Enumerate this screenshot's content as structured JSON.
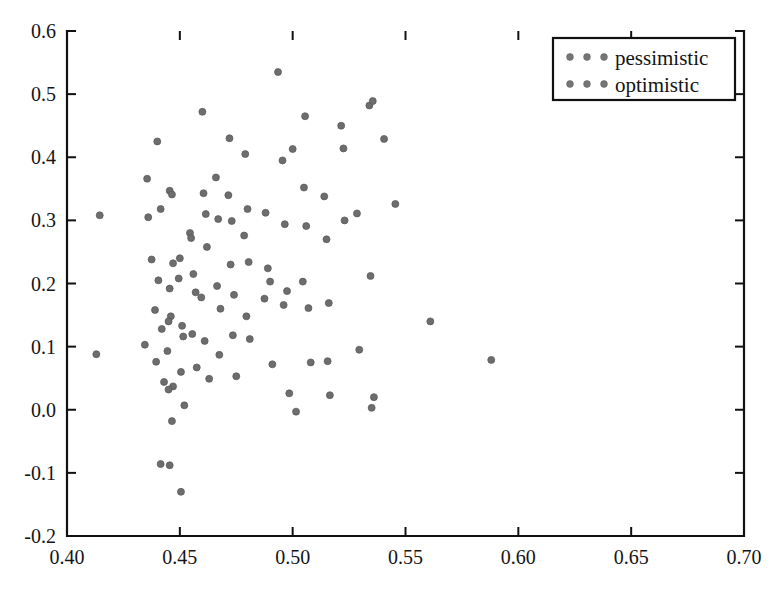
{
  "chart_data": {
    "type": "scatter",
    "title": "",
    "xlabel": "",
    "ylabel": "",
    "xlim": [
      0.4,
      0.7
    ],
    "ylim": [
      -0.2,
      0.6
    ],
    "grid": false,
    "xticks": [
      0.4,
      0.45,
      0.5,
      0.55,
      0.6,
      0.65,
      0.7
    ],
    "xtick_labels": [
      "0.40",
      "0.45",
      "0.50",
      "0.55",
      "0.60",
      "0.65",
      "0.70"
    ],
    "yticks": [
      -0.2,
      -0.1,
      0.0,
      0.1,
      0.2,
      0.3,
      0.4,
      0.5,
      0.6
    ],
    "ytick_labels": [
      "-0.2",
      "-0.1",
      "0.0",
      "0.1",
      "0.2",
      "0.3",
      "0.4",
      "0.5",
      "0.6"
    ],
    "marker_color": "#6d6d6d",
    "marker_size": 7,
    "legend": {
      "position": "upper right",
      "entries": [
        {
          "label": "pessimistic",
          "color": "#767676",
          "marker": "circle"
        },
        {
          "label": "optimistic",
          "color": "#767676",
          "marker": "circle"
        }
      ]
    },
    "series": [
      {
        "name": "pessimistic",
        "points": [
          [
            0.4145,
            0.308
          ],
          [
            0.413,
            0.088
          ],
          [
            0.4355,
            0.366
          ],
          [
            0.436,
            0.305
          ],
          [
            0.4375,
            0.238
          ],
          [
            0.439,
            0.158
          ],
          [
            0.4345,
            0.103
          ],
          [
            0.44,
            0.425
          ],
          [
            0.4415,
            0.318
          ],
          [
            0.4405,
            0.205
          ],
          [
            0.442,
            0.128
          ],
          [
            0.4395,
            0.076
          ],
          [
            0.443,
            0.044
          ],
          [
            0.4415,
            -0.086
          ],
          [
            0.4455,
            0.347
          ],
          [
            0.4465,
            0.341
          ],
          [
            0.447,
            0.232
          ],
          [
            0.4455,
            0.192
          ],
          [
            0.446,
            0.148
          ],
          [
            0.445,
            0.14
          ],
          [
            0.4445,
            0.093
          ],
          [
            0.447,
            0.037
          ],
          [
            0.445,
            0.032
          ],
          [
            0.4465,
            -0.018
          ],
          [
            0.4455,
            -0.088
          ],
          [
            0.4505,
            -0.13
          ],
          [
            0.45,
            0.24
          ],
          [
            0.4495,
            0.208
          ],
          [
            0.451,
            0.133
          ],
          [
            0.4515,
            0.116
          ],
          [
            0.4505,
            0.06
          ],
          [
            0.452,
            0.007
          ],
          [
            0.4545,
            0.28
          ],
          [
            0.455,
            0.272
          ],
          [
            0.456,
            0.215
          ],
          [
            0.457,
            0.186
          ],
          [
            0.4555,
            0.12
          ],
          [
            0.4575,
            0.067
          ],
          [
            0.46,
            0.472
          ],
          [
            0.4605,
            0.343
          ],
          [
            0.4615,
            0.31
          ],
          [
            0.462,
            0.258
          ],
          [
            0.4595,
            0.178
          ],
          [
            0.461,
            0.109
          ],
          [
            0.463,
            0.049
          ],
          [
            0.466,
            0.368
          ],
          [
            0.467,
            0.302
          ],
          [
            0.4665,
            0.196
          ],
          [
            0.468,
            0.16
          ],
          [
            0.4675,
            0.087
          ]
        ]
      },
      {
        "name": "optimistic",
        "points": [
          [
            0.472,
            0.43
          ],
          [
            0.4715,
            0.34
          ],
          [
            0.473,
            0.299
          ],
          [
            0.4725,
            0.23
          ],
          [
            0.474,
            0.182
          ],
          [
            0.4735,
            0.118
          ],
          [
            0.475,
            0.053
          ],
          [
            0.479,
            0.405
          ],
          [
            0.48,
            0.318
          ],
          [
            0.4785,
            0.276
          ],
          [
            0.4805,
            0.234
          ],
          [
            0.4795,
            0.148
          ],
          [
            0.481,
            0.112
          ],
          [
            0.4935,
            0.535
          ],
          [
            0.488,
            0.312
          ],
          [
            0.489,
            0.224
          ],
          [
            0.49,
            0.203
          ],
          [
            0.4875,
            0.176
          ],
          [
            0.491,
            0.072
          ],
          [
            0.4955,
            0.395
          ],
          [
            0.4965,
            0.294
          ],
          [
            0.4975,
            0.188
          ],
          [
            0.496,
            0.166
          ],
          [
            0.4985,
            0.026
          ],
          [
            0.5,
            0.413
          ],
          [
            0.5015,
            -0.003
          ],
          [
            0.5055,
            0.465
          ],
          [
            0.505,
            0.352
          ],
          [
            0.506,
            0.291
          ],
          [
            0.5045,
            0.203
          ],
          [
            0.507,
            0.161
          ],
          [
            0.508,
            0.075
          ],
          [
            0.514,
            0.338
          ],
          [
            0.515,
            0.27
          ],
          [
            0.516,
            0.169
          ],
          [
            0.5155,
            0.077
          ],
          [
            0.5165,
            0.023
          ],
          [
            0.5215,
            0.45
          ],
          [
            0.5225,
            0.414
          ],
          [
            0.523,
            0.3
          ],
          [
            0.5285,
            0.311
          ],
          [
            0.5295,
            0.095
          ],
          [
            0.534,
            0.482
          ],
          [
            0.5355,
            0.489
          ],
          [
            0.5345,
            0.212
          ],
          [
            0.535,
            0.003
          ],
          [
            0.536,
            0.02
          ],
          [
            0.5405,
            0.429
          ],
          [
            0.5455,
            0.326
          ],
          [
            0.561,
            0.14
          ],
          [
            0.588,
            0.079
          ]
        ]
      }
    ]
  }
}
